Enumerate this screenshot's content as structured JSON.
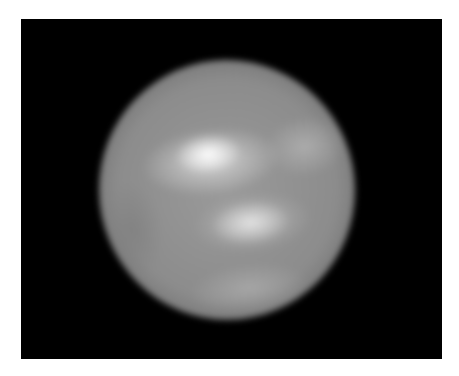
{
  "image": {
    "subject": "blurry grayscale sphere on black background",
    "background_color": "#000000",
    "border_color": "#ffffff"
  }
}
